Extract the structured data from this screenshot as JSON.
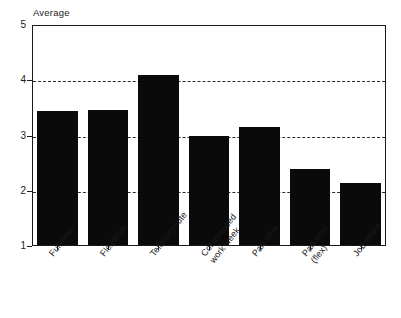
{
  "chart_data": {
    "type": "bar",
    "title": "",
    "subtitle": "",
    "xlabel": "",
    "ylabel": "Average",
    "ylim": [
      1,
      5
    ],
    "y_ticks": [
      "1",
      "2",
      "3",
      "4",
      "5"
    ],
    "grid": "horizontal dashed gridlines at 2, 3 and 4",
    "gridline_values": [
      2,
      3,
      4
    ],
    "legend": "none",
    "categories": [
      "Full-time",
      "Flexitime",
      "Telecommute",
      "Compressed work week",
      "Part-time",
      "Part-time (flex)",
      "Job share"
    ],
    "category_lines": [
      [
        "Full-time"
      ],
      [
        "Flexitime"
      ],
      [
        "Telecommute"
      ],
      [
        "Compressed",
        "work week"
      ],
      [
        "Part-time"
      ],
      [
        "Part-time",
        "(flex)"
      ],
      [
        "Job share"
      ]
    ],
    "values": [
      3.42,
      3.45,
      4.08,
      2.98,
      3.14,
      2.38,
      2.13
    ],
    "bar_color": "#0a0a0a",
    "axis_color": "#1a1a1a",
    "background": "#ffffff"
  }
}
